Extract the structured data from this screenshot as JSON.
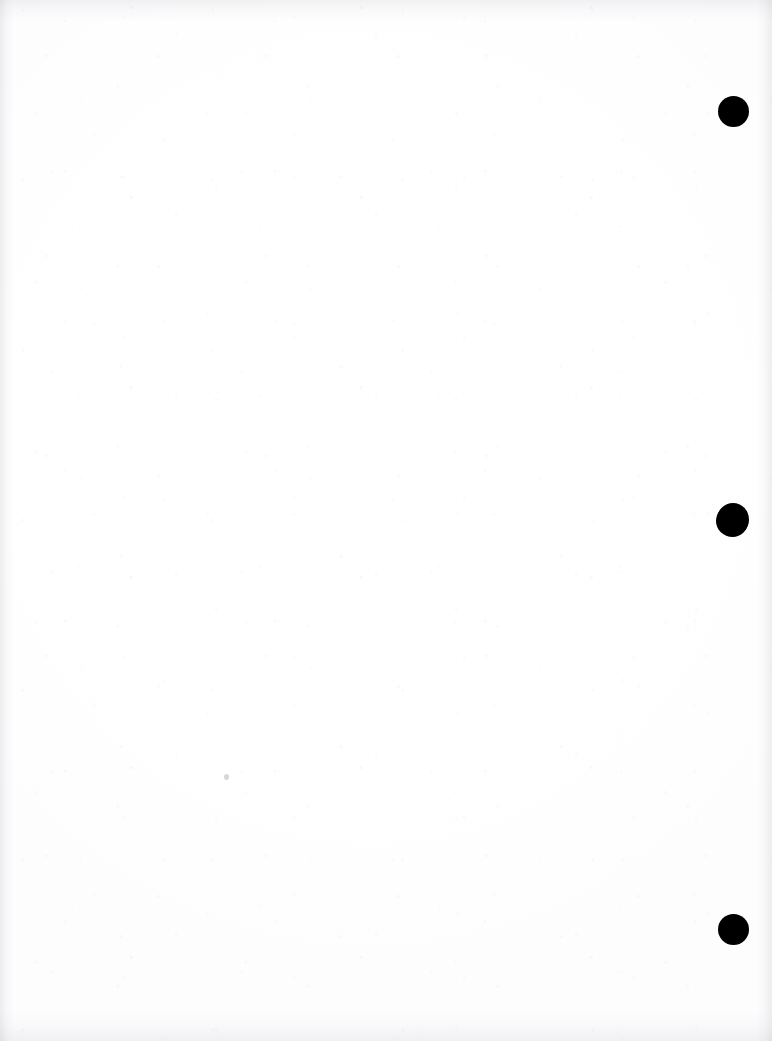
{
  "document": {
    "kind": "scanned-blank-page",
    "page_width": 772,
    "page_height": 1041,
    "page_background": "#fefefe",
    "content_text": "",
    "note": ""
  },
  "marks": {
    "ink_color": "#000000",
    "punch_holes": [
      {
        "name": "punch-hole-top",
        "cx": 733,
        "cy": 111,
        "diameter": 31
      },
      {
        "name": "punch-hole-middle",
        "cx": 733,
        "cy": 519,
        "diameter": 32
      },
      {
        "name": "punch-hole-bottom",
        "cx": 733,
        "cy": 929,
        "diameter": 31
      }
    ],
    "specks": [
      {
        "name": "stray-speck",
        "cx": 226,
        "cy": 776,
        "diameter": 5,
        "color": "#78788722"
      }
    ]
  },
  "scan": {
    "edge_shadow_color": "#92929e",
    "noise_tint": "#a0a0af"
  }
}
